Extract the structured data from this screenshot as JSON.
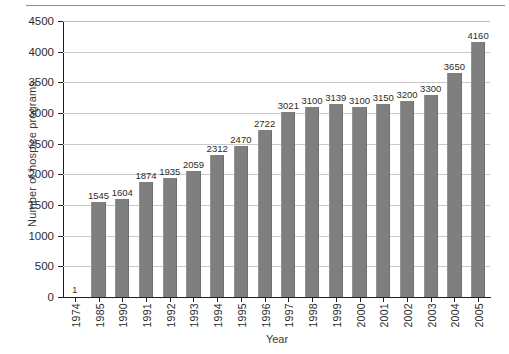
{
  "chart_data": {
    "type": "bar",
    "title": "",
    "xlabel": "Year",
    "ylabel": "Number of hospice programs",
    "categories": [
      "1974",
      "1985",
      "1990",
      "1991",
      "1992",
      "1993",
      "1994",
      "1995",
      "1996",
      "1997",
      "1998",
      "1999",
      "2000",
      "2001",
      "2002",
      "2003",
      "2004",
      "2005"
    ],
    "values": [
      1,
      1545,
      1604,
      1874,
      1935,
      2059,
      2312,
      2470,
      2722,
      3021,
      3100,
      3139,
      3100,
      3150,
      3200,
      3300,
      3650,
      4160
    ],
    "data_labels": [
      "1",
      "1545",
      "1604",
      "1874",
      "1935",
      "2059",
      "2312",
      "2470",
      "2722",
      "3021",
      "3100",
      "3139",
      "3100",
      "3150",
      "3200",
      "3300",
      "3650",
      "4160"
    ],
    "ylim": [
      0,
      4500
    ],
    "yticks": [
      0,
      500,
      1000,
      1500,
      2000,
      2500,
      3000,
      3500,
      4000,
      4500
    ],
    "ytick_labels": [
      "0",
      "500",
      "1000",
      "1500",
      "2000",
      "2500",
      "3000",
      "3500",
      "4000",
      "4500"
    ],
    "grid": "horizontal",
    "legend": "none",
    "bar_color": "#7f7f7f",
    "axis_color": "#1f1f1f",
    "grid_color": "#c9c9c9",
    "background": "#ffffff"
  }
}
